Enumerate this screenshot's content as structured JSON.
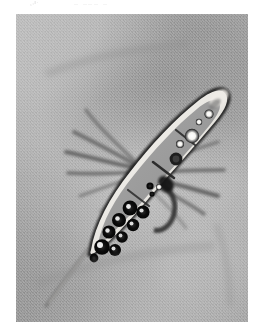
{
  "page": {
    "kind": "photomicrograph-plate",
    "background_color": "#ffffff"
  },
  "top_text": {
    "fragment_left": "¸,ı·",
    "fragment_right": "‥ ‥‥‥ ‥"
  },
  "micrograph": {
    "title": "phase-contrast photomicrograph",
    "frame": {
      "x": 16,
      "y": 14,
      "width": 232,
      "height": 308
    },
    "background_color": "#a9a9a9",
    "background_description": "mottled mid-gray phase-contrast field with soft granular texture",
    "specimen": {
      "name": "fusiform multicellular conidium with radiating appendages",
      "orientation": "diagonal, lower-left to upper-right",
      "long_axis_angle_deg": -58,
      "wall_color": "#f2f0ec",
      "outline_color": "#1c1c1c",
      "lumen_color": "#9b9b9b",
      "cell_count_visible": 4,
      "septa_count": 3,
      "apex": "rounded, upper-right",
      "tail": "thin tapering filament, lower-left"
    },
    "appendages": {
      "name": "radiating bristle-like appendages",
      "color": "#5e5e5e",
      "left_fan_count": 6,
      "right_fan_count": 6,
      "description": "dark slender filaments fanning outward from the mid-region on both sides"
    },
    "inclusions": {
      "dark_globules": {
        "label": "dark refractive globules",
        "ring_color": "#0d0d0d",
        "highlight_color": "#ffffff",
        "count": 9,
        "location": "lower cell, toward the tapering tail"
      },
      "bright_globules": {
        "label": "bright refractive oil droplets",
        "ring_color": "#1a1a1a",
        "core_color": "#fdfdfb",
        "count": 4,
        "location": "upper cell, toward the apex"
      },
      "septal_spot": {
        "label": "dark septal spot",
        "color": "#161616"
      }
    }
  }
}
